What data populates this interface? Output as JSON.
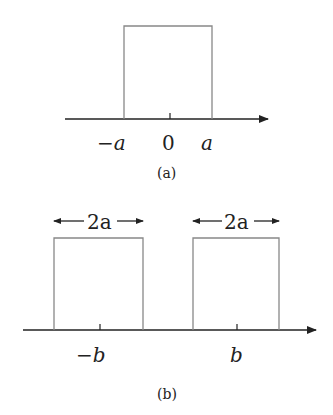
{
  "panel_a": {
    "caption": "(a)",
    "labels": {
      "left": "−a",
      "center": "0",
      "right": "a"
    }
  },
  "panel_b": {
    "caption": "(b)",
    "width_labels": [
      "2a",
      "2a"
    ],
    "labels": {
      "left": "−b",
      "right": "b"
    }
  },
  "colors": {
    "pulse": "#888888",
    "axis": "#222222"
  }
}
